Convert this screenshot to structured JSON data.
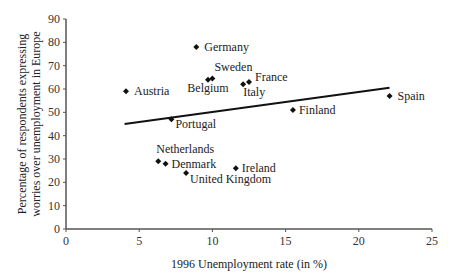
{
  "chart_data": {
    "type": "scatter",
    "title": "",
    "xlabel": "1996 Unemployment rate (in %)",
    "ylabel_lines": [
      "Percentage of respondents expressing",
      "worries over unemployment in Europe"
    ],
    "xlim": [
      0,
      25
    ],
    "ylim": [
      0,
      90
    ],
    "xticks": [
      0,
      5,
      10,
      15,
      20,
      25
    ],
    "yticks": [
      0,
      10,
      20,
      30,
      40,
      50,
      60,
      70,
      80,
      90
    ],
    "grid": false,
    "points": [
      {
        "label": "Germany",
        "x": 8.9,
        "y": 78
      },
      {
        "label": "Austria",
        "x": 4.1,
        "y": 59
      },
      {
        "label": "Sweden",
        "x": 10.0,
        "y": 64.5
      },
      {
        "label": "Belgium",
        "x": 9.7,
        "y": 64
      },
      {
        "label": "France",
        "x": 12.5,
        "y": 63
      },
      {
        "label": "Italy",
        "x": 12.1,
        "y": 62
      },
      {
        "label": "Finland",
        "x": 15.5,
        "y": 51
      },
      {
        "label": "Spain",
        "x": 22.1,
        "y": 57
      },
      {
        "label": "Portugal",
        "x": 7.2,
        "y": 47
      },
      {
        "label": "Netherlands",
        "x": 6.3,
        "y": 29
      },
      {
        "label": "Denmark",
        "x": 6.8,
        "y": 28
      },
      {
        "label": "United Kingdom",
        "x": 8.2,
        "y": 24
      },
      {
        "label": "Ireland",
        "x": 11.6,
        "y": 26
      }
    ],
    "trendline": {
      "x1": 4,
      "y1": 45,
      "x2": 22.1,
      "y2": 60.5
    }
  }
}
